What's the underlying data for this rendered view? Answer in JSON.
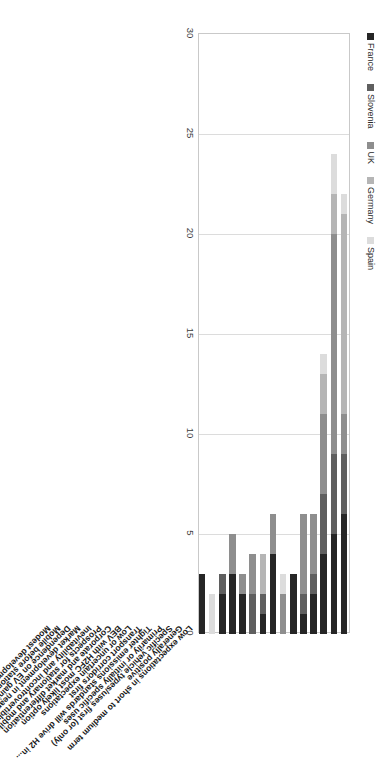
{
  "chart_data": {
    "type": "bar",
    "orientation": "horizontal-stacked",
    "title": "",
    "xlabel": "",
    "ylabel": "",
    "xlim": [
      0,
      30
    ],
    "xticks": [
      0,
      5,
      10,
      15,
      20,
      25,
      30
    ],
    "grid": true,
    "legend_position": "bottom",
    "categories": [
      "Low expectations in short to medium term",
      "Generally positive",
      "Specific vehicle types/uses first (or only)",
      "Primarily or initially specific uses",
      "Tighter emissions standards will drive H2 in...",
      "Transport corridors first",
      "Low or uncertain expectations",
      "BEV with H2FC most likely option",
      "Corporate and market differentiation",
      "Prospects for stationary and mobile applications",
      "Inevitability and incontrovertibly valuable",
      "Market development in near term",
      "Dependence on EV gaining market share",
      "Mobile before stationary",
      "Modest development relative to other countries"
    ],
    "series": [
      {
        "name": "France",
        "color": "#262626",
        "values": [
          6,
          5,
          4,
          2,
          1,
          3,
          0,
          4,
          1,
          0,
          2,
          3,
          2,
          0,
          3
        ]
      },
      {
        "name": "Slovenia",
        "color": "#5f5f5f",
        "values": [
          3,
          4,
          3,
          1,
          1,
          0,
          0,
          0,
          1,
          2,
          0,
          0,
          1,
          0,
          0
        ]
      },
      {
        "name": "UK",
        "color": "#8e8e8e",
        "values": [
          2,
          11,
          4,
          3,
          4,
          0,
          2,
          2,
          0,
          2,
          1,
          2,
          0,
          0,
          0
        ]
      },
      {
        "name": "Germany",
        "color": "#b5b5b5",
        "values": [
          10,
          2,
          2,
          0,
          0,
          0,
          0,
          0,
          2,
          0,
          0,
          0,
          0,
          0,
          0
        ]
      },
      {
        "name": "Spain",
        "color": "#dcdcdc",
        "values": [
          1,
          2,
          1,
          0,
          0,
          0,
          1,
          0,
          0,
          0,
          0,
          0,
          0,
          2,
          0
        ]
      }
    ]
  },
  "legend": {
    "items": [
      {
        "label": "France",
        "color": "#262626"
      },
      {
        "label": "Slovenia",
        "color": "#5f5f5f"
      },
      {
        "label": "UK",
        "color": "#8e8e8e"
      },
      {
        "label": "Germany",
        "color": "#b5b5b5"
      },
      {
        "label": "Spain",
        "color": "#dcdcdc"
      }
    ]
  }
}
